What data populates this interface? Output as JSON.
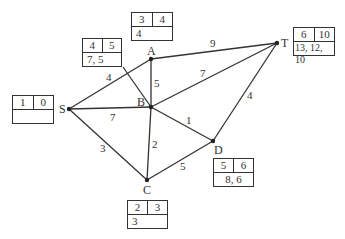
{
  "nodes": {
    "S": {
      "label": "S",
      "box": {
        "early": "1",
        "late": "0",
        "bottom": ""
      }
    },
    "A": {
      "label": "A",
      "box": {
        "early": "3",
        "late": "4",
        "bottom": "4"
      }
    },
    "B": {
      "label": "B",
      "box": {
        "early": "4",
        "late": "5",
        "bottom": "7, 5"
      }
    },
    "C": {
      "label": "C",
      "box": {
        "early": "2",
        "late": "3",
        "bottom": "3"
      }
    },
    "D": {
      "label": "D",
      "box": {
        "early": "5",
        "late": "6",
        "bottom": "8, 6"
      }
    },
    "T": {
      "label": "T",
      "box": {
        "early": "6",
        "late": "10",
        "bottom": "13, 12, 10"
      }
    }
  },
  "edges": {
    "SA": "4",
    "SB": "7",
    "SC": "3",
    "AB": "5",
    "AT": "9",
    "BT": "7",
    "BD": "1",
    "BC": "2",
    "CD": "5",
    "DT": "4"
  }
}
